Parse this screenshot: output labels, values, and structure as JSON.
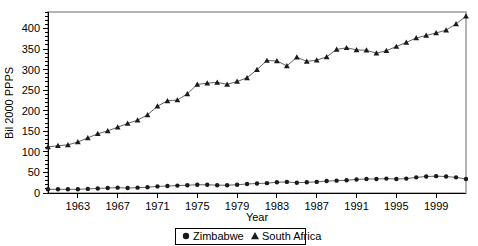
{
  "chart_data": {
    "type": "line",
    "title": "",
    "xlabel": "Year",
    "ylabel": "Bil 2000 PPPS",
    "xlim": [
      1960,
      2002
    ],
    "ylim": [
      0,
      440
    ],
    "ytick_step": 50,
    "yminor_step": 10,
    "xtick_step": 4,
    "grid": false,
    "legend_position": "bottom",
    "x": [
      1960,
      1961,
      1962,
      1963,
      1964,
      1965,
      1966,
      1967,
      1968,
      1969,
      1970,
      1971,
      1972,
      1973,
      1974,
      1975,
      1976,
      1977,
      1978,
      1979,
      1980,
      1981,
      1982,
      1983,
      1984,
      1985,
      1986,
      1987,
      1988,
      1989,
      1990,
      1991,
      1992,
      1993,
      1994,
      1995,
      1996,
      1997,
      1998,
      1999,
      2000,
      2001,
      2002
    ],
    "xticks": [
      1963,
      1967,
      1971,
      1975,
      1979,
      1983,
      1987,
      1991,
      1995,
      1999
    ],
    "yticks": [
      0,
      50,
      100,
      150,
      200,
      250,
      300,
      350,
      400
    ],
    "series": [
      {
        "name": "Zimbabwe",
        "marker": "circle",
        "color": "#1a1a1a",
        "values": [
          9,
          9,
          9,
          9,
          10,
          11,
          12,
          13,
          12,
          13,
          14,
          16,
          17,
          18,
          19,
          20,
          20,
          19,
          19,
          20,
          22,
          23,
          24,
          26,
          27,
          25,
          26,
          27,
          29,
          30,
          31,
          33,
          34,
          34,
          35,
          34,
          35,
          38,
          40,
          41,
          40,
          38,
          34
        ]
      },
      {
        "name": "South Africa",
        "marker": "triangle",
        "color": "#1a1a1a",
        "values": [
          112,
          115,
          117,
          124,
          134,
          144,
          151,
          160,
          169,
          177,
          190,
          211,
          224,
          226,
          241,
          264,
          267,
          269,
          264,
          271,
          280,
          300,
          322,
          321,
          309,
          330,
          320,
          323,
          331,
          349,
          353,
          348,
          347,
          340,
          346,
          356,
          366,
          377,
          383,
          389,
          396,
          411,
          430
        ]
      }
    ]
  },
  "legend": {
    "items": [
      {
        "marker_symbol": "circle-marker",
        "label": "Zimbabwe"
      },
      {
        "marker_symbol": "triangle-marker",
        "label": "South Africa"
      }
    ]
  },
  "axis_titles": {
    "x": "Year",
    "y": "Bil 2000 PPPS"
  }
}
